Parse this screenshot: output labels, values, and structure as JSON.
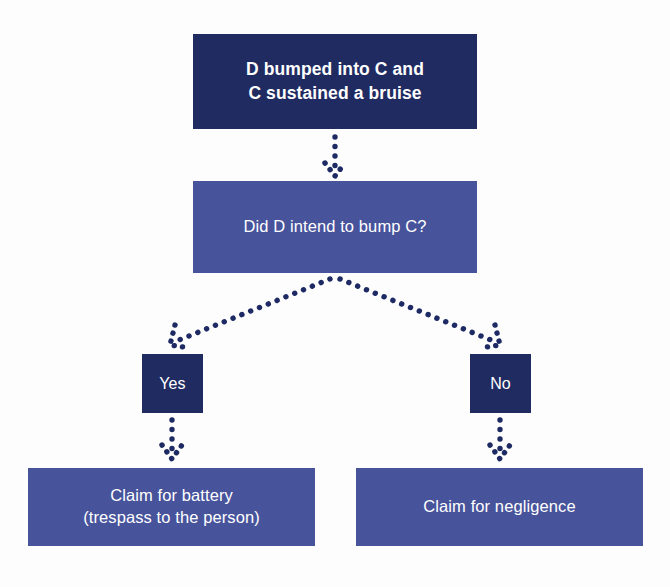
{
  "diagram": {
    "type": "flowchart",
    "background_color": "#fdfdfd",
    "colors": {
      "node_dark": "#202b62",
      "node_mid": "#47539b",
      "node_text": "#ffffff",
      "connector": "#1e2a63"
    },
    "nodes": [
      {
        "id": "premise",
        "role": "start",
        "style": "dark",
        "bold": true,
        "line1": "D bumped into C and",
        "line2": "C sustained a bruise"
      },
      {
        "id": "question",
        "role": "decision",
        "style": "mid",
        "bold": false,
        "line1": "Did D intend to bump C?",
        "line2": ""
      },
      {
        "id": "yes",
        "role": "branch-label",
        "style": "dark",
        "bold": false,
        "line1": "Yes",
        "line2": ""
      },
      {
        "id": "no",
        "role": "branch-label",
        "style": "dark",
        "bold": false,
        "line1": "No",
        "line2": ""
      },
      {
        "id": "battery",
        "role": "outcome",
        "style": "mid",
        "bold": false,
        "line1": "Claim for battery",
        "line2": "(trespass to the person)"
      },
      {
        "id": "negligence",
        "role": "outcome",
        "style": "mid",
        "bold": false,
        "line1": "Claim for negligence",
        "line2": ""
      }
    ],
    "edges": [
      {
        "id": "premise-to-question",
        "from": "premise",
        "to": "question",
        "label": "",
        "style": "dotted-arrow",
        "direction": "down"
      },
      {
        "id": "question-to-yes",
        "from": "question",
        "to": "yes",
        "label": "",
        "style": "dotted-arrow",
        "direction": "down-left"
      },
      {
        "id": "question-to-no",
        "from": "question",
        "to": "no",
        "label": "",
        "style": "dotted-arrow",
        "direction": "down-right"
      },
      {
        "id": "yes-to-battery",
        "from": "yes",
        "to": "battery",
        "label": "",
        "style": "dotted-arrow",
        "direction": "down"
      },
      {
        "id": "no-to-negligence",
        "from": "no",
        "to": "negligence",
        "label": "",
        "style": "dotted-arrow",
        "direction": "down"
      }
    ]
  }
}
